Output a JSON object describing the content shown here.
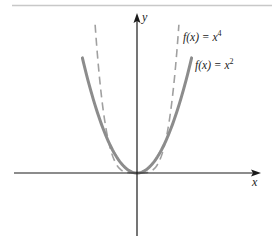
{
  "chart_data": {
    "type": "line",
    "title": "",
    "xlabel": "x",
    "ylabel": "y",
    "grid": false,
    "legend_position": "inline-labels",
    "axis_ranges": {
      "x": [
        -4.5,
        4.3
      ],
      "y": [
        -2.1,
        5.3
      ]
    },
    "series": [
      {
        "name": "f(x) = x^2",
        "label_text": {
          "prefix": "f(x) = x",
          "exponent": "2"
        },
        "style": "solid",
        "color": "#8a8a8a",
        "function": "x^2",
        "x_domain": [
          -1.93,
          1.93
        ],
        "samples": [
          {
            "x": -1.93,
            "y": 3.72
          },
          {
            "x": -1.5,
            "y": 2.25
          },
          {
            "x": -1.0,
            "y": 1.0
          },
          {
            "x": -0.5,
            "y": 0.25
          },
          {
            "x": 0,
            "y": 0
          },
          {
            "x": 0.5,
            "y": 0.25
          },
          {
            "x": 1.0,
            "y": 1.0
          },
          {
            "x": 1.5,
            "y": 2.25
          },
          {
            "x": 1.93,
            "y": 3.72
          }
        ]
      },
      {
        "name": "f(x) = x^4",
        "label_text": {
          "prefix": "f(x) = x",
          "exponent": "4"
        },
        "style": "dashed",
        "color": "#9a9a9a",
        "function": "x^4",
        "x_domain": [
          -1.48,
          1.48
        ],
        "samples": [
          {
            "x": -1.48,
            "y": 4.8
          },
          {
            "x": -1.25,
            "y": 2.44
          },
          {
            "x": -1.0,
            "y": 1.0
          },
          {
            "x": -0.5,
            "y": 0.0625
          },
          {
            "x": 0,
            "y": 0
          },
          {
            "x": 0.5,
            "y": 0.0625
          },
          {
            "x": 1.0,
            "y": 1.0
          },
          {
            "x": 1.25,
            "y": 2.44
          },
          {
            "x": 1.48,
            "y": 4.8
          }
        ]
      }
    ],
    "annotations": [
      {
        "text": "f(x) = x^4",
        "near_series": "f(x) = x^4"
      },
      {
        "text": "f(x) = x^2",
        "near_series": "f(x) = x^2"
      }
    ]
  },
  "labels": {
    "x_axis": "x",
    "y_axis": "y",
    "x4_prefix": "f(x) = x",
    "x4_exp": "4",
    "x2_prefix": "f(x) = x",
    "x2_exp": "2"
  }
}
